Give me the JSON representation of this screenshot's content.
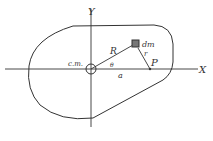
{
  "diagram": {
    "axes": {
      "x_label": "X",
      "y_label": "Y"
    },
    "labels": {
      "center_of_mass": "c.m.",
      "mass_element": "dm",
      "distance_R": "R",
      "distance_r": "r",
      "angle": "θ",
      "distance_a": "a",
      "point": "P"
    },
    "colors": {
      "stroke": "#333333",
      "background": "#ffffff"
    }
  }
}
